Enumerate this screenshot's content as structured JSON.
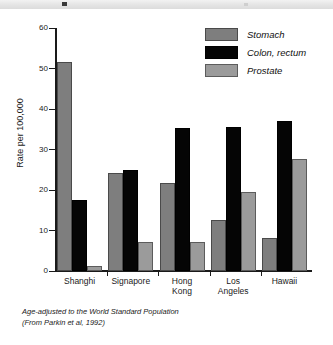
{
  "banner": {
    "mark": "banner-mark"
  },
  "chart_data": {
    "type": "bar",
    "title": "",
    "xlabel": "",
    "ylabel": "Rate per 100,000",
    "ylim": [
      0,
      60
    ],
    "yticks": [
      0,
      10,
      20,
      30,
      40,
      50,
      60
    ],
    "ytick_labels": [
      "0",
      "10",
      "20",
      "30",
      "40",
      "50",
      "60"
    ],
    "grid": false,
    "legend_position": "top-right",
    "categories": [
      "Shanghi",
      "Signapore",
      "Hong Kong",
      "Los Angeles",
      "Hawaii"
    ],
    "category_lines": [
      [
        "Shanghi"
      ],
      [
        "Signapore"
      ],
      [
        "Hong",
        "Kong"
      ],
      [
        "Los",
        "Angeles"
      ],
      [
        "Hawaii"
      ]
    ],
    "series": [
      {
        "name": "Stomach",
        "color": "#7e7e7e",
        "values": [
          51.5,
          24.3,
          21.8,
          12.6,
          8.2
        ]
      },
      {
        "name": "Colon, rectum",
        "color": "#050505",
        "values": [
          17.5,
          25.0,
          35.2,
          35.6,
          37.0
        ]
      },
      {
        "name": "Prostate",
        "color": "#9b9b9b",
        "values": [
          1.3,
          7.2,
          7.2,
          19.5,
          27.7
        ]
      }
    ]
  },
  "footnote": {
    "line1": "Age-adjusted to the World Standard Population",
    "line2": "(From Parkin et al, 1992)"
  }
}
